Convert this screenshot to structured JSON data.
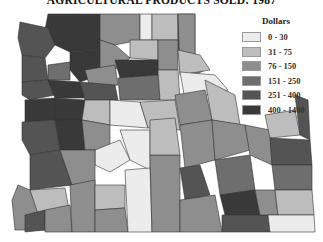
{
  "title": "AGRICULTURAL PRODUCTS SOLD: 1987",
  "legend": {
    "title": "Dollars",
    "items": [
      {
        "label": "0 - 30",
        "color": "#ececec"
      },
      {
        "label": "31 - 75",
        "color": "#bdbdbd"
      },
      {
        "label": "76 - 150",
        "color": "#8e8e8e"
      },
      {
        "label": "151 - 250",
        "color": "#6e6e6e"
      },
      {
        "label": "251 - 400",
        "color": "#545454"
      },
      {
        "label": "400 - 1400",
        "color": "#393939"
      }
    ]
  },
  "map": {
    "region": "Pacific Northwest (Washington, Oregon, Idaho)",
    "type": "choropleth by county"
  }
}
